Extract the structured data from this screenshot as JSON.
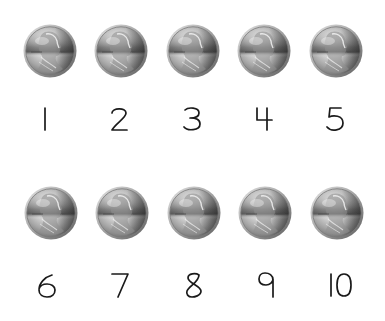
{
  "worksheet": {
    "coin_icon": "penny-icon",
    "coin_label": "Penny",
    "colors": {
      "background": "#ffffff",
      "numeral": "#1a1a1a",
      "coin_light": "#f2f2f2",
      "coin_mid": "#b8b8b8",
      "coin_dark": "#5a5a5a",
      "coin_rim": "#8c8c8c"
    },
    "rows": [
      {
        "items": [
          {
            "number": "1",
            "coin_cx": 50,
            "coin_cy": 51,
            "num_cx": 45,
            "num_cy": 119
          },
          {
            "number": "2",
            "coin_cx": 121,
            "coin_cy": 51,
            "num_cx": 119,
            "num_cy": 119
          },
          {
            "number": "3",
            "coin_cx": 193,
            "coin_cy": 51,
            "num_cx": 192,
            "num_cy": 119
          },
          {
            "number": "4",
            "coin_cx": 264,
            "coin_cy": 51,
            "num_cx": 264,
            "num_cy": 119
          },
          {
            "number": "5",
            "coin_cx": 336,
            "coin_cy": 51,
            "num_cx": 335,
            "num_cy": 119
          }
        ]
      },
      {
        "items": [
          {
            "number": "6",
            "coin_cx": 51,
            "coin_cy": 213,
            "num_cx": 47,
            "num_cy": 285
          },
          {
            "number": "7",
            "coin_cx": 122,
            "coin_cy": 213,
            "num_cx": 120,
            "num_cy": 285
          },
          {
            "number": "8",
            "coin_cx": 194,
            "coin_cy": 213,
            "num_cx": 194,
            "num_cy": 285
          },
          {
            "number": "9",
            "coin_cx": 265,
            "coin_cy": 213,
            "num_cx": 266,
            "num_cy": 285
          },
          {
            "number": "10",
            "coin_cx": 337,
            "coin_cy": 213,
            "num_cx": 341,
            "num_cy": 285
          }
        ]
      }
    ]
  }
}
